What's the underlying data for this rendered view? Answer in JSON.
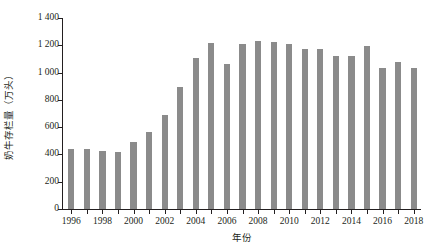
{
  "chart_data": {
    "type": "bar",
    "title": "",
    "xlabel": "年份",
    "ylabel": "奶牛存栏量（万头）",
    "categories": [
      "1996",
      "1997",
      "1998",
      "1999",
      "2000",
      "2001",
      "2002",
      "2003",
      "2004",
      "2005",
      "2006",
      "2007",
      "2008",
      "2009",
      "2010",
      "2011",
      "2012",
      "2013",
      "2014",
      "2015",
      "2016",
      "2017",
      "2018"
    ],
    "values": [
      443,
      440,
      426,
      421,
      489,
      566,
      687,
      893,
      1105,
      1216,
      1064,
      1213,
      1230,
      1221,
      1207,
      1174,
      1175,
      1120,
      1124,
      1197,
      1032,
      1075,
      1033
    ],
    "series": [
      {
        "name": "奶牛存栏量",
        "values": [
          443,
          440,
          426,
          421,
          489,
          566,
          687,
          893,
          1105,
          1216,
          1064,
          1213,
          1230,
          1221,
          1207,
          1174,
          1175,
          1120,
          1124,
          1197,
          1032,
          1075,
          1033
        ]
      }
    ],
    "ylim": [
      0,
      1400
    ],
    "y_ticks": [
      0,
      200,
      400,
      600,
      800,
      1000,
      1200,
      1400
    ],
    "y_tick_labels": [
      "0",
      "200",
      "400",
      "600",
      "800",
      "1 000",
      "1 200",
      "1 400"
    ],
    "x_tick_labels": [
      "1996",
      "1998",
      "2000",
      "2002",
      "2004",
      "2006",
      "2008",
      "2010",
      "2012",
      "2014",
      "2016",
      "2018"
    ],
    "grid": false,
    "legend": "none",
    "bar_color": "#8b8b8b",
    "axis_color": "#231f20",
    "background_color": "#ffffff"
  }
}
